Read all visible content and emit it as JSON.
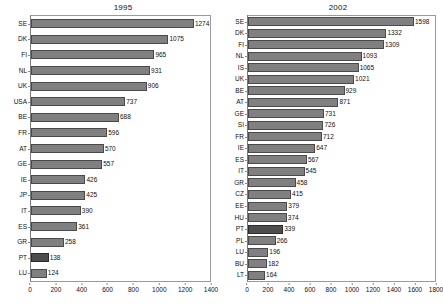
{
  "chart_data": [
    {
      "type": "bar",
      "orientation": "horizontal",
      "title": "1995",
      "xlabel": "",
      "ylabel": "",
      "xlim": [
        0,
        1400
      ],
      "xticks": [
        0,
        200,
        400,
        600,
        800,
        1000,
        1200,
        1400
      ],
      "grid": false,
      "legend": "none",
      "bar_color": "#808080",
      "highlight_color": "#4d4d4d",
      "highlight_category": "PT",
      "categories": [
        "SE",
        "DK",
        "FI",
        "NL",
        "UK",
        "USA",
        "BE",
        "FR",
        "AT",
        "GE",
        "IE",
        "JP",
        "IT",
        "ES",
        "GR",
        "PT",
        "LU"
      ],
      "values": [
        1274,
        1075,
        965,
        931,
        906,
        737,
        688,
        596,
        570,
        557,
        426,
        425,
        390,
        361,
        258,
        138,
        124
      ]
    },
    {
      "type": "bar",
      "orientation": "horizontal",
      "title": "2002",
      "xlabel": "",
      "ylabel": "",
      "xlim": [
        0,
        1800
      ],
      "xticks": [
        0,
        200,
        400,
        600,
        800,
        1000,
        1200,
        1400,
        1600,
        1800
      ],
      "grid": false,
      "legend": "none",
      "bar_color": "#808080",
      "highlight_color": "#4d4d4d",
      "highlight_category": "PT",
      "categories": [
        "SE",
        "DK",
        "FI",
        "NL",
        "IS",
        "UK",
        "BE",
        "AT",
        "GE",
        "SI",
        "FR",
        "IE",
        "ES",
        "IT",
        "GR",
        "CZ",
        "EE",
        "HU",
        "PT",
        "PL",
        "LU",
        "BU",
        "LT"
      ],
      "values": [
        1598,
        1332,
        1309,
        1093,
        1065,
        1021,
        929,
        871,
        731,
        726,
        712,
        647,
        567,
        545,
        458,
        415,
        379,
        374,
        339,
        266,
        196,
        182,
        164
      ]
    }
  ]
}
